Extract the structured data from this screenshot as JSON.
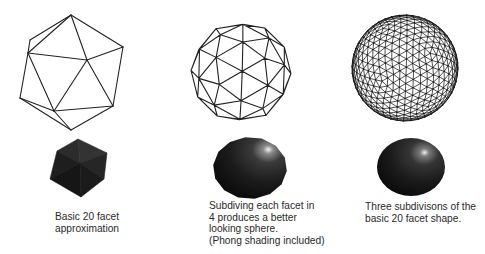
{
  "figure": {
    "columns": [
      {
        "id": "basic",
        "subdivisions": 0,
        "caption_lines": [
          "Basic 20 facet",
          "approximation"
        ],
        "wireframe": {
          "vertices": {
            "A": [
              71,
              15
            ],
            "B": [
              30,
              40
            ],
            "C": [
              28,
              53
            ],
            "D": [
              87,
              60
            ],
            "E": [
              123,
              47
            ],
            "F": [
              20,
              98
            ],
            "G": [
              54,
              111
            ],
            "H": [
              113,
              106
            ],
            "I": [
              71,
              130
            ]
          },
          "edges": [
            [
              "A",
              "B"
            ],
            [
              "A",
              "C"
            ],
            [
              "A",
              "D"
            ],
            [
              "A",
              "E"
            ],
            [
              "B",
              "C"
            ],
            [
              "C",
              "D"
            ],
            [
              "D",
              "E"
            ],
            [
              "C",
              "F"
            ],
            [
              "C",
              "G"
            ],
            [
              "D",
              "G"
            ],
            [
              "D",
              "H"
            ],
            [
              "E",
              "H"
            ],
            [
              "F",
              "G"
            ],
            [
              "G",
              "H"
            ],
            [
              "F",
              "I"
            ],
            [
              "G",
              "I"
            ],
            [
              "H",
              "I"
            ]
          ]
        },
        "shaded": {
          "vertices": {
            "T": [
              78,
              139
            ],
            "UL": [
              57,
              151
            ],
            "UR": [
              107,
              153
            ],
            "C": [
              80,
              163
            ],
            "LL": [
              50,
              179
            ],
            "LR": [
              104,
              179
            ],
            "B": [
              81,
              197
            ]
          },
          "faces": [
            {
              "pts": [
                "T",
                "UL",
                "C"
              ],
              "fill": "#2c2c2c"
            },
            {
              "pts": [
                "T",
                "C",
                "UR"
              ],
              "fill": "#333333"
            },
            {
              "pts": [
                "UL",
                "LL",
                "C"
              ],
              "fill": "#1e1e1e"
            },
            {
              "pts": [
                "UR",
                "C",
                "LR"
              ],
              "fill": "#262626"
            },
            {
              "pts": [
                "LL",
                "B",
                "C"
              ],
              "fill": "#161616"
            },
            {
              "pts": [
                "C",
                "B",
                "LR"
              ],
              "fill": "#1b1b1b"
            }
          ]
        }
      },
      {
        "id": "subdivided-once",
        "subdivisions": 1,
        "caption_lines": [
          "Subdiving each facet in",
          "4 produces a better",
          "looking sphere.",
          "(Phong shading included)"
        ],
        "wireframe": {
          "cx": 241,
          "cy": 72,
          "r": 50,
          "rot": [
            0.35,
            0.55,
            0.15
          ],
          "stroke_width": 1.1
        },
        "shaded": {
          "cx": 250,
          "cy": 168,
          "rx": 37,
          "ry": 31,
          "highlight": [
            269,
            151
          ],
          "sides": 14
        }
      },
      {
        "id": "subdivided-three",
        "subdivisions": 3,
        "caption_lines": [
          "Three subdivisons of the",
          "basic 20 facet shape."
        ],
        "wireframe": {
          "cx": 405,
          "cy": 68,
          "r": 53,
          "rot": [
            0.35,
            0.55,
            0.15
          ],
          "stroke_width": 0.75
        },
        "shaded": {
          "cx": 411,
          "cy": 167,
          "rx": 34,
          "ry": 29,
          "highlight": [
            425,
            153
          ]
        }
      }
    ],
    "colors": {
      "line": "#222222",
      "text": "#2a2a2a",
      "sphere_dark": "#0e0e0e",
      "sphere_mid": "#2a2a2a",
      "highlight": "#f2f2f2"
    }
  }
}
